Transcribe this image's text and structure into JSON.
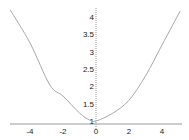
{
  "chart_data": {
    "type": "line",
    "title": "",
    "xlabel": "",
    "ylabel": "",
    "xlim": [
      -5.2,
      5.2
    ],
    "ylim": [
      0.91,
      4.3
    ],
    "grid": false,
    "legend": null,
    "x_ticks": [
      "-4",
      "-2",
      "0",
      "2",
      "4"
    ],
    "y_ticks": [
      "1",
      "1.5",
      "2",
      "2.5",
      "3",
      "3.5",
      "4"
    ],
    "series": [
      {
        "name": "curve",
        "color": "#a8a8a8",
        "x": [
          -5.2,
          -4,
          -2.8,
          -2,
          -1,
          -0.4,
          0,
          1,
          2,
          3,
          4,
          5.1
        ],
        "y": [
          4.2,
          3.25,
          2.04,
          1.72,
          1.23,
          1.03,
          1.0,
          1.22,
          1.6,
          2.3,
          3.19,
          4.17
        ]
      }
    ],
    "axis_color": "#9a9a9a",
    "label_color": "#222222"
  }
}
